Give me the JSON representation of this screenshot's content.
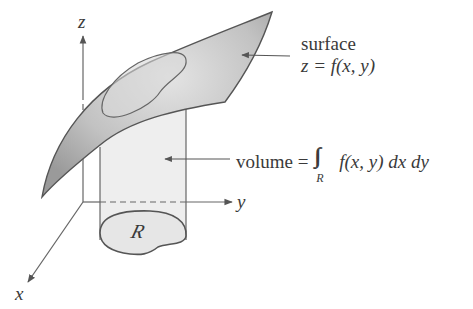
{
  "diagram": {
    "axes": {
      "z_label": "z",
      "y_label": "y",
      "x_label": "x"
    },
    "region_label": "R",
    "surface_annotation": {
      "line1": "surface",
      "line2": "z = f(x, y)"
    },
    "volume_annotation": {
      "prefix": "volume = ",
      "integral_symbol": "∫∫",
      "integral_subscript": "R",
      "integrand": "f(x, y) dx dy"
    },
    "colors": {
      "surface_fill": "#a9a9a9",
      "surface_stroke": "#555555",
      "column_fill": "#ececec",
      "line": "#555555",
      "text": "#3a3a3a"
    }
  }
}
